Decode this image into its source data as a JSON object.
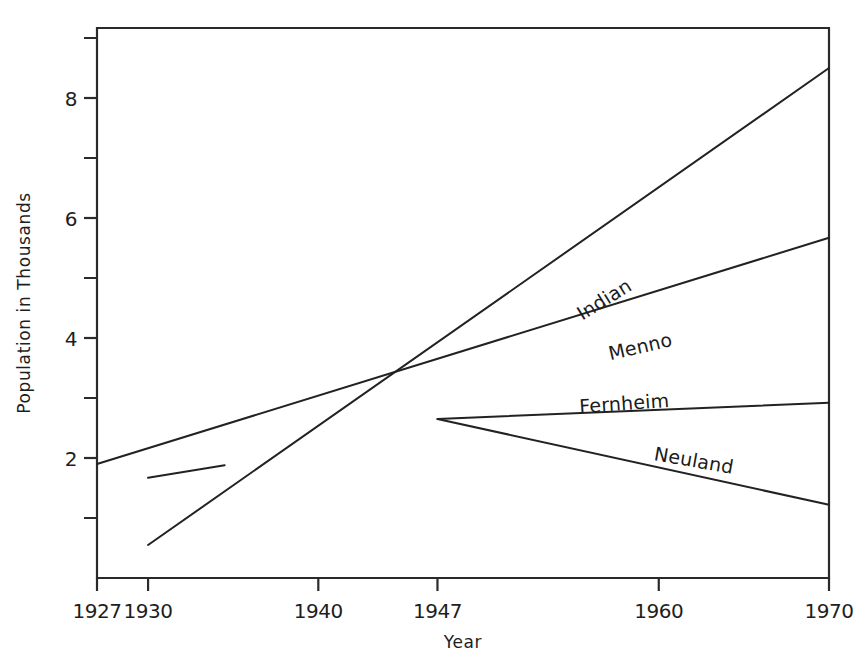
{
  "chart_data": {
    "type": "line",
    "title": "",
    "xlabel": "Year",
    "ylabel": "Population in Thousands",
    "xlim": [
      1927,
      1970
    ],
    "ylim": [
      0,
      9.17
    ],
    "grid": false,
    "legend_position": "inline-labels",
    "x_ticks": [
      {
        "value": 1927,
        "label": "1927"
      },
      {
        "value": 1930,
        "label": "1930"
      },
      {
        "value": 1940,
        "label": "1940"
      },
      {
        "value": 1947,
        "label": "1947"
      },
      {
        "value": 1960,
        "label": "1960"
      },
      {
        "value": 1970,
        "label": "1970"
      }
    ],
    "y_ticks_major": [
      {
        "value": 2,
        "label": "2"
      },
      {
        "value": 4,
        "label": "4"
      },
      {
        "value": 6,
        "label": "6"
      },
      {
        "value": 8,
        "label": "8"
      }
    ],
    "y_ticks_minor": [
      1,
      3,
      5,
      7,
      9
    ],
    "series": [
      {
        "name": "Indian",
        "label": "Indian",
        "label_x": 1957,
        "label_y": 4.55,
        "label_rotation": -32,
        "x": [
          1930,
          1970
        ],
        "values": [
          0.55,
          8.5
        ]
      },
      {
        "name": "Menno",
        "label": "Menno",
        "label_x": 1959,
        "label_y": 3.75,
        "label_rotation": -13,
        "x": [
          1927,
          1970
        ],
        "values": [
          1.9,
          5.67
        ]
      },
      {
        "name": "Fernheim",
        "label": "Fernheim",
        "label_x": 1958,
        "label_y": 2.8,
        "label_rotation": -4,
        "x": [
          1947,
          1970
        ],
        "values": [
          2.65,
          2.92
        ]
      },
      {
        "name": "Neuland",
        "label": "Neuland",
        "label_x": 1962,
        "label_y": 1.85,
        "label_rotation": 10,
        "x": [
          1947,
          1970
        ],
        "values": [
          2.65,
          1.22
        ]
      },
      {
        "name": "Fernheim-early",
        "label": "",
        "label_x": null,
        "label_y": null,
        "label_rotation": 0,
        "x": [
          1930,
          1934.5
        ],
        "values": [
          1.67,
          1.88
        ]
      }
    ]
  }
}
